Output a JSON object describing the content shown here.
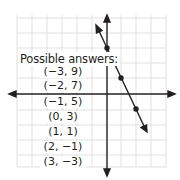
{
  "graph": {
    "grid": {
      "x_min": -6,
      "x_max": 4,
      "y_min": -5,
      "y_max": 5,
      "color": "#d9d9d9"
    },
    "axes_color": "#231f20",
    "line": {
      "equation": "y = -2x + 3",
      "points": [
        [
          0,
          3
        ],
        [
          1,
          1
        ],
        [
          2,
          -1
        ]
      ],
      "color": "#231f20"
    }
  },
  "answers": {
    "title": "Possible answers:",
    "items": [
      "(−3, 9)",
      "(−2, 7)",
      "(−1, 5)",
      "(0, 3)",
      "(1, 1)",
      "(2, −1)",
      "(3, −3)"
    ]
  }
}
